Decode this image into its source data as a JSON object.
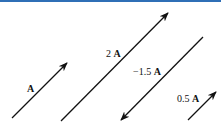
{
  "diagram": {
    "type": "vector-scalar-multiples",
    "vectors": [
      {
        "id": "A",
        "coef": "",
        "sym": "A",
        "from": [
          12,
          118
        ],
        "to": [
          67,
          63
        ],
        "label_pos": [
          27,
          84
        ]
      },
      {
        "id": "2A",
        "coef": "2 ",
        "sym": "A",
        "from": [
          61,
          121
        ],
        "to": [
          168,
          13
        ],
        "label_pos": [
          106,
          49
        ]
      },
      {
        "id": "-1.5A",
        "coef": "−1.5 ",
        "sym": "A",
        "from": [
          203,
          37
        ],
        "to": [
          121,
          120
        ],
        "label_pos": [
          133,
          67
        ]
      },
      {
        "id": "0.5A",
        "coef": "0.5 ",
        "sym": "A",
        "from": [
          188,
          120
        ],
        "to": [
          216,
          92
        ],
        "label_pos": [
          177,
          94
        ]
      }
    ],
    "colors": {
      "stroke": "#111111",
      "topbar": "#2f6fb6"
    }
  }
}
